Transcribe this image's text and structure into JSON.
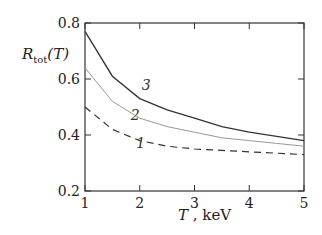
{
  "chart_data": {
    "type": "line",
    "title": "",
    "xlabel": "T , keV",
    "ylabel": "R_tot(T)",
    "xlim": [
      1,
      5
    ],
    "ylim": [
      0.2,
      0.8
    ],
    "x_ticks": [
      "1",
      "2",
      "3",
      "4",
      "5"
    ],
    "y_ticks": [
      "0.2",
      "0.4",
      "0.6",
      "0.8"
    ],
    "grid": false,
    "x": [
      1,
      1.5,
      2,
      2.5,
      3,
      3.5,
      4,
      4.5,
      5
    ],
    "series": [
      {
        "name": "1",
        "style": "dashed",
        "values": [
          0.5,
          0.42,
          0.38,
          0.36,
          0.35,
          0.345,
          0.34,
          0.335,
          0.33
        ]
      },
      {
        "name": "2",
        "style": "dotted",
        "values": [
          0.64,
          0.52,
          0.46,
          0.43,
          0.41,
          0.39,
          0.38,
          0.37,
          0.36
        ]
      },
      {
        "name": "3",
        "style": "solid",
        "values": [
          0.77,
          0.61,
          0.53,
          0.49,
          0.46,
          0.43,
          0.41,
          0.395,
          0.38
        ]
      }
    ]
  }
}
